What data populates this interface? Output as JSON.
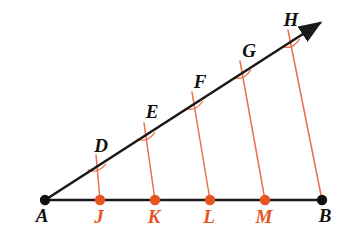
{
  "figure": {
    "width": 355,
    "height": 246,
    "background": "#FFFFFF"
  },
  "colors": {
    "line_black": "#1A1A1A",
    "point_black": "#111111",
    "orange_accent": "#E8541F",
    "orange_line": "#E8714A",
    "orange_label": "#E8541F",
    "label_black": "#111111"
  },
  "labels": {
    "A": "A",
    "B": "B",
    "D": "D",
    "E": "E",
    "F": "F",
    "G": "G",
    "H": "H",
    "J": "J",
    "K": "K",
    "L": "L",
    "M": "M"
  },
  "chart_data": {
    "type": "scatter",
    "xlabel": "",
    "ylabel": "",
    "xlim": [
      0,
      355
    ],
    "ylim": [
      0,
      246
    ],
    "grid": false,
    "legend": "none",
    "vertex": {
      "name": "A",
      "x": 45,
      "y": 200
    },
    "base_ray": {
      "name": "ray-AB",
      "from": [
        45,
        200
      ],
      "to": [
        322,
        200
      ],
      "color": "#1A1A1A",
      "arrow": false
    },
    "upper_ray": {
      "name": "ray-AH",
      "from": [
        45,
        200
      ],
      "to": [
        320,
        23
      ],
      "color": "#1A1A1A",
      "arrow": true
    },
    "base_points": [
      {
        "label": "A",
        "x": 45,
        "y": 200,
        "color": "#111111",
        "label_x": 42,
        "label_y": 222
      },
      {
        "label": "J",
        "x": 100,
        "y": 200,
        "color": "#E8541F",
        "label_x": 99,
        "label_y": 223
      },
      {
        "label": "K",
        "x": 155,
        "y": 200,
        "color": "#E8541F",
        "label_x": 154,
        "label_y": 223
      },
      {
        "label": "L",
        "x": 210,
        "y": 200,
        "color": "#E8541F",
        "label_x": 209,
        "label_y": 223
      },
      {
        "label": "M",
        "x": 265,
        "y": 200,
        "color": "#E8541F",
        "label_x": 264,
        "label_y": 223
      },
      {
        "label": "B",
        "x": 322,
        "y": 200,
        "color": "#111111",
        "label_x": 325,
        "label_y": 222
      }
    ],
    "ray_points": [
      {
        "label": "D",
        "x": 97,
        "y": 167,
        "label_x": 101,
        "label_y": 152
      },
      {
        "label": "E",
        "x": 146,
        "y": 136,
        "label_x": 152,
        "label_y": 118
      },
      {
        "label": "F",
        "x": 194,
        "y": 105,
        "label_x": 200,
        "label_y": 88
      },
      {
        "label": "G",
        "x": 242,
        "y": 74,
        "label_x": 249,
        "label_y": 57
      },
      {
        "label": "H",
        "x": 291,
        "y": 43,
        "label_x": 291,
        "label_y": 26
      }
    ],
    "transversals": [
      {
        "name": "JD",
        "from_label": "J",
        "to_label": "D",
        "x1": 100,
        "y1": 200,
        "x2": 97,
        "y2": 167,
        "ext_x": 96,
        "ext_y": 155,
        "color": "#E8714A"
      },
      {
        "name": "KE",
        "from_label": "K",
        "to_label": "E",
        "x1": 155,
        "y1": 200,
        "x2": 146,
        "y2": 136,
        "ext_x": 144,
        "ext_y": 123,
        "color": "#E8714A"
      },
      {
        "name": "LF",
        "from_label": "L",
        "to_label": "F",
        "x1": 210,
        "y1": 200,
        "x2": 194,
        "y2": 105,
        "ext_x": 192,
        "ext_y": 92,
        "color": "#E8714A"
      },
      {
        "name": "MG",
        "from_label": "M",
        "to_label": "G",
        "x1": 265,
        "y1": 200,
        "x2": 242,
        "y2": 74,
        "ext_x": 240,
        "ext_y": 61,
        "color": "#E8714A"
      },
      {
        "name": "BH",
        "from_label": "B",
        "to_label": "H",
        "x1": 322,
        "y1": 200,
        "x2": 291,
        "y2": 43,
        "ext_x": 288,
        "ext_y": 30,
        "color": "#E8714A"
      }
    ]
  }
}
